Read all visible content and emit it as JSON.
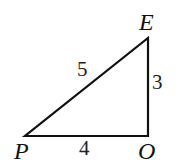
{
  "diagram": {
    "type": "right-triangle",
    "vertices": {
      "P": {
        "label": "P",
        "x": 25,
        "y": 136
      },
      "O": {
        "label": "O",
        "x": 148,
        "y": 136
      },
      "E": {
        "label": "E",
        "x": 148,
        "y": 38
      }
    },
    "sides": {
      "PE": {
        "label": "5"
      },
      "EO": {
        "label": "3"
      },
      "PO": {
        "label": "4"
      }
    },
    "colors": {
      "stroke": "#111111",
      "background": "#ffffff"
    }
  }
}
